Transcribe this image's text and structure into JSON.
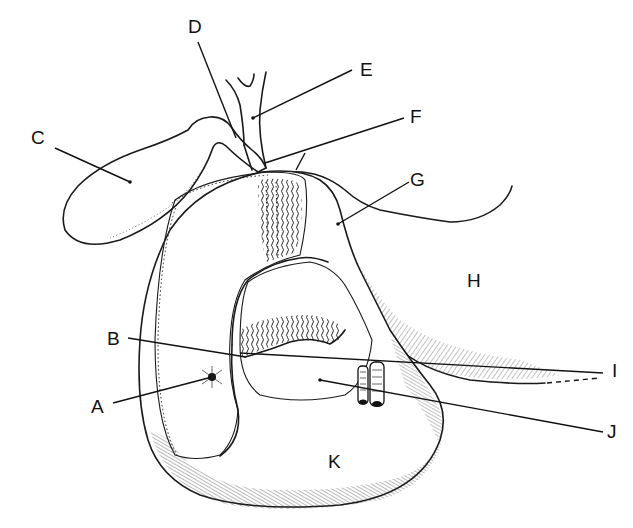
{
  "figure": {
    "type": "anatomical-line-drawing",
    "labels": [
      {
        "id": "A",
        "text": "A",
        "x": 91,
        "y": 397,
        "target": [
          212,
          377
        ]
      },
      {
        "id": "B",
        "text": "B",
        "x": 107,
        "y": 329,
        "target": [
          246,
          357
        ]
      },
      {
        "id": "C",
        "text": "C",
        "x": 31,
        "y": 128,
        "target": [
          130,
          182
        ]
      },
      {
        "id": "D",
        "text": "D",
        "x": 188,
        "y": 17,
        "target": [
          236,
          138
        ]
      },
      {
        "id": "E",
        "text": "E",
        "x": 360,
        "y": 60,
        "target": [
          253,
          118
        ]
      },
      {
        "id": "F",
        "text": "F",
        "x": 410,
        "y": 107,
        "target": [
          265,
          163
        ]
      },
      {
        "id": "G",
        "text": "G",
        "x": 410,
        "y": 170,
        "target": [
          338,
          224
        ]
      },
      {
        "id": "H",
        "text": "H",
        "x": 467,
        "y": 271,
        "target": null
      },
      {
        "id": "I",
        "text": "I",
        "x": 612,
        "y": 361,
        "target": [
          240,
          358
        ]
      },
      {
        "id": "J",
        "text": "J",
        "x": 607,
        "y": 422,
        "target": [
          320,
          380
        ]
      },
      {
        "id": "K",
        "text": "K",
        "x": 328,
        "y": 452,
        "target": null
      }
    ]
  }
}
